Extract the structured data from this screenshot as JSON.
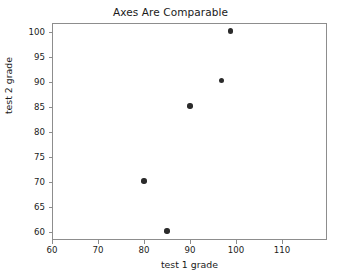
{
  "chart_data": {
    "type": "scatter",
    "title": "Axes Are Comparable",
    "xlabel": "test 1 grade",
    "ylabel": "test 2 grade",
    "xlim": [
      60,
      119.8
    ],
    "ylim": [
      58.4,
      101.8
    ],
    "xticks": [
      60,
      70,
      80,
      90,
      100,
      110
    ],
    "yticks": [
      60,
      65,
      70,
      75,
      80,
      85,
      90,
      95,
      100
    ],
    "xtick_labels": [
      "60",
      "70",
      "80",
      "90",
      "100",
      "110"
    ],
    "ytick_labels": [
      "60",
      "65",
      "70",
      "75",
      "80",
      "85",
      "90",
      "95",
      "100"
    ],
    "grid": false,
    "legend": null,
    "marker_color": "#2b2b2b",
    "axes_color": "#8d8d8d",
    "background_color": "#ffffff",
    "points": [
      {
        "x": 80,
        "y": 70.2
      },
      {
        "x": 85,
        "y": 60.2
      },
      {
        "x": 90,
        "y": 85.2
      },
      {
        "x": 96.8,
        "y": 90.3
      },
      {
        "x": 98.8,
        "y": 100.2
      }
    ]
  }
}
